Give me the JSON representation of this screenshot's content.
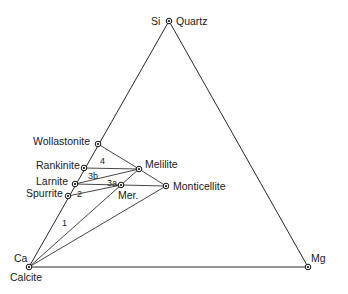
{
  "diagram": {
    "type": "ternary-phase-diagram",
    "vertices": [
      {
        "id": "si",
        "element": "Si",
        "mineral": "Quartz",
        "x": 169,
        "y": 21
      },
      {
        "id": "ca",
        "element": "Ca",
        "mineral": "Calcite",
        "x": 29,
        "y": 267
      },
      {
        "id": "mg",
        "element": "Mg",
        "mineral": "",
        "x": 308,
        "y": 267
      }
    ],
    "phases": [
      {
        "id": "wollastonite",
        "label": "Wollastonite",
        "x": 98,
        "y": 144
      },
      {
        "id": "rankinite",
        "label": "Rankinite",
        "x": 84,
        "y": 168
      },
      {
        "id": "larnite",
        "label": "Larnite",
        "x": 75,
        "y": 184
      },
      {
        "id": "spurrite",
        "label": "Spurrite",
        "x": 68,
        "y": 196
      },
      {
        "id": "melilite",
        "label": "Melilite",
        "x": 139,
        "y": 169
      },
      {
        "id": "merwinite",
        "label": "Mer.",
        "x": 121,
        "y": 185
      },
      {
        "id": "monticellite",
        "label": "Monticellite",
        "x": 166,
        "y": 186
      }
    ],
    "tie_lines": [
      [
        "wollastonite",
        "melilite"
      ],
      [
        "melilite",
        "monticellite"
      ],
      [
        "rankinite",
        "melilite"
      ],
      [
        "larnite",
        "melilite"
      ],
      [
        "larnite",
        "merwinite"
      ],
      [
        "merwinite",
        "monticellite"
      ],
      [
        "spurrite",
        "merwinite"
      ],
      [
        "ca",
        "merwinite"
      ],
      [
        "ca",
        "monticellite"
      ],
      [
        "merwinite",
        "melilite"
      ]
    ],
    "field_labels": [
      {
        "id": "field-4",
        "text": "4",
        "x": 102,
        "y": 163
      },
      {
        "id": "field-3b",
        "text": "3b",
        "x": 88,
        "y": 178
      },
      {
        "id": "field-3a",
        "text": "3a",
        "x": 107,
        "y": 185
      },
      {
        "id": "field-2",
        "text": "2",
        "x": 77,
        "y": 195
      },
      {
        "id": "field-1",
        "text": "1",
        "x": 62,
        "y": 225
      }
    ],
    "vertex_labels": {
      "si": "Si",
      "quartz": "Quartz",
      "ca": "Ca",
      "calcite": "Calcite",
      "mg": "Mg"
    }
  }
}
